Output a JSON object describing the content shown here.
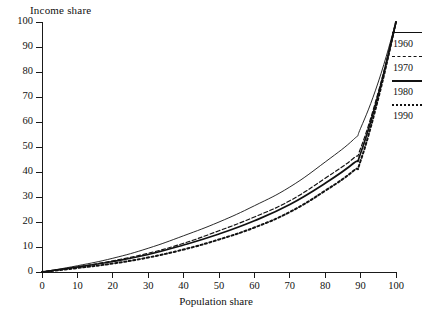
{
  "chart_data": {
    "type": "line",
    "title": "",
    "xlabel": "Population share",
    "ylabel": "Income share",
    "xlim": [
      0,
      100
    ],
    "ylim": [
      0,
      100
    ],
    "grid": false,
    "legend_position": "right",
    "xticks": [
      "0",
      "10",
      "20",
      "30",
      "40",
      "50",
      "60",
      "70",
      "80",
      "90",
      "100"
    ],
    "yticks": [
      "0",
      "10",
      "20",
      "30",
      "40",
      "50",
      "60",
      "70",
      "80",
      "90",
      "100"
    ],
    "x": [
      0,
      10,
      20,
      30,
      40,
      50,
      60,
      70,
      80,
      88,
      90,
      95,
      100
    ],
    "series": [
      {
        "name": "1960",
        "style": "solid-thin",
        "values": [
          0,
          2.5,
          5.5,
          9.5,
          14.5,
          20.0,
          26.5,
          34.0,
          44.0,
          53.0,
          57.5,
          76.0,
          100
        ]
      },
      {
        "name": "1970",
        "style": "dashed",
        "values": [
          0,
          2.0,
          4.5,
          7.5,
          11.5,
          16.5,
          22.0,
          28.5,
          37.5,
          45.5,
          49.5,
          72.0,
          100
        ]
      },
      {
        "name": "1980",
        "style": "solid-thick",
        "values": [
          0,
          2.0,
          4.2,
          7.0,
          10.8,
          15.2,
          20.5,
          27.0,
          35.5,
          43.5,
          47.5,
          71.0,
          100
        ]
      },
      {
        "name": "1990",
        "style": "dotted",
        "values": [
          0,
          1.6,
          3.4,
          5.8,
          9.0,
          13.0,
          17.8,
          24.0,
          32.5,
          40.5,
          44.5,
          69.5,
          100
        ]
      }
    ]
  },
  "axes": {
    "y_title": "Income share",
    "x_title": "Population share"
  },
  "legend": {
    "entries": [
      {
        "label": "1960",
        "style": "solid-thin"
      },
      {
        "label": "1970",
        "style": "dashed"
      },
      {
        "label": "1980",
        "style": "solid-thick"
      },
      {
        "label": "1990",
        "style": "dotted"
      }
    ]
  },
  "colors": {
    "ink": "#111111",
    "background": "#ffffff"
  }
}
